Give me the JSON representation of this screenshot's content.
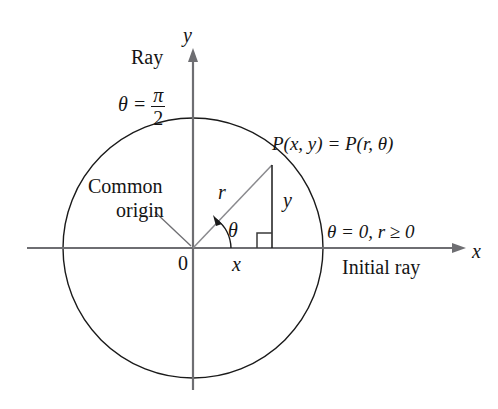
{
  "figure": {
    "colors": {
      "background": "#ffffff",
      "circle": "#1a1a1a",
      "axis": "#6e6e72",
      "radius_line": "#8a8a8e",
      "vertical_line": "#1a1a1a",
      "text": "#141414",
      "leader": "#6e6e72"
    },
    "labels": {
      "ray": "Ray",
      "theta_pi_over_2_lhs": "θ =",
      "pi_numerator": "π",
      "two_denominator": "2",
      "y_axis": "y",
      "x_axis": "x",
      "point_label": "P(x, y) = P(r, θ)",
      "common": "Common",
      "origin": "origin",
      "zero": "0",
      "r": "r",
      "theta": "θ",
      "x_component": "x",
      "y_component": "y",
      "theta_zero_r": "θ = 0, r ≥ 0",
      "initial_ray": "Initial ray"
    },
    "geometry": {
      "origin_x": 193,
      "origin_y": 248,
      "circle_radius": 130,
      "point_x": 272,
      "point_y": 165,
      "x_axis_start": 27,
      "x_axis_end": 466,
      "y_axis_top": 48,
      "y_axis_bottom": 390,
      "right_angle_size": 15,
      "theta_arc_radius": 38,
      "theta_degrees": 46
    }
  }
}
